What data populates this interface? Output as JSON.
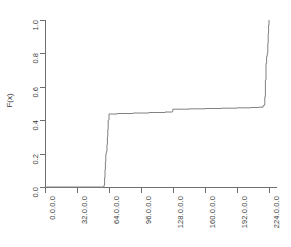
{
  "chart_data": {
    "type": "line",
    "title": "",
    "subtitle": "",
    "xlabel": "",
    "ylabel": "F(x)",
    "xlim": [
      0,
      232
    ],
    "ylim": [
      0.0,
      1.0
    ],
    "grid": false,
    "legend": null,
    "step_shape": "hv",
    "x_tick_labels": [
      "0.0.0.0",
      "32.0.0.0",
      "64.0.0.0",
      "96.0.0.0",
      "128.0.0.0",
      "160.0.0.0",
      "192.0.0.0",
      "224.0.0.0"
    ],
    "x_tick_values": [
      0,
      32,
      64,
      96,
      128,
      160,
      192,
      224
    ],
    "y_tick_labels": [
      "0.0",
      "0.2",
      "0.4",
      "0.6",
      "0.8",
      "1.0"
    ],
    "y_tick_values": [
      0.0,
      0.2,
      0.4,
      0.6,
      0.8,
      1.0
    ],
    "series": [
      {
        "name": "ECDF",
        "color": "#808080",
        "x": [
          0,
          58.5,
          59.0,
          59.6,
          60.0,
          60.4,
          60.8,
          61.2,
          61.6,
          62.0,
          62.4,
          62.8,
          63.2,
          64.0,
          72.0,
          88.0,
          104.0,
          120.0,
          127.4,
          127.8,
          144.0,
          160.0,
          176.0,
          192.0,
          206.0,
          214.0,
          218.0,
          219.2,
          219.8,
          220.4,
          221.0,
          221.6,
          222.2,
          222.8,
          223.2,
          223.6,
          224.0
        ],
        "y": [
          0.0,
          0.0,
          0.012,
          0.055,
          0.105,
          0.152,
          0.195,
          0.205,
          0.215,
          0.255,
          0.3,
          0.345,
          0.4,
          0.437,
          0.44,
          0.443,
          0.446,
          0.449,
          0.452,
          0.466,
          0.468,
          0.47,
          0.472,
          0.474,
          0.476,
          0.478,
          0.487,
          0.492,
          0.54,
          0.64,
          0.74,
          0.782,
          0.8,
          0.86,
          0.92,
          0.97,
          1.0
        ]
      }
    ]
  },
  "axes": {
    "y_title": "F(x)"
  }
}
